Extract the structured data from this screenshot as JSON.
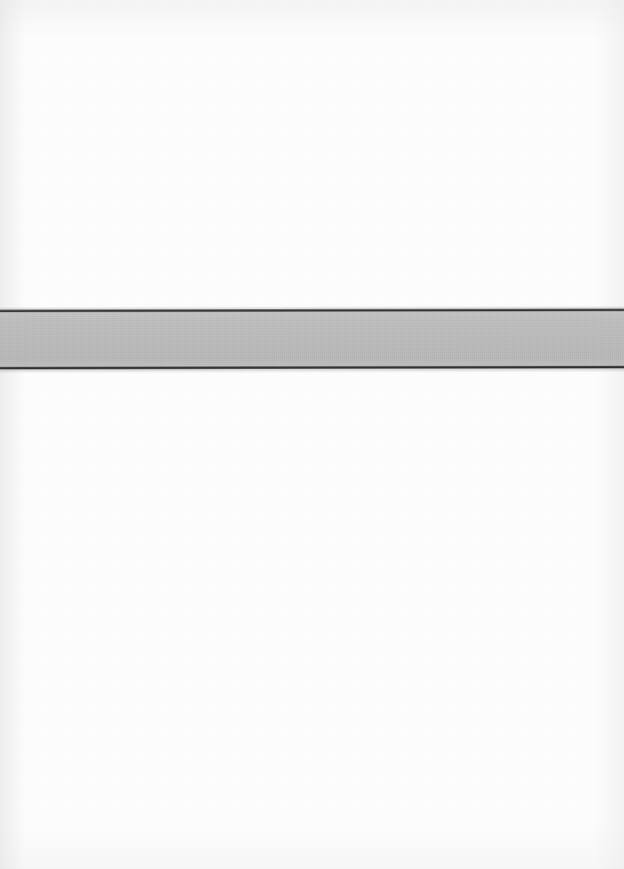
{
  "document": {
    "kind": "scanned-page",
    "page_background": "#ffffff",
    "width": 624,
    "height": 869,
    "text_content": "",
    "notes": ""
  },
  "band": {
    "name": "horizontal-gray-band",
    "top": 309,
    "height": 60,
    "left": 0,
    "width": 624,
    "fill_color": "#bcbcbc",
    "rule_color": "#2f2f2f",
    "rule_thickness": 3,
    "skew_degrees": -0.1,
    "label": ""
  },
  "regions": {
    "above_band": {
      "name": "blank-area-above",
      "top": 0,
      "height": 309,
      "color": "#ffffff",
      "label": ""
    },
    "below_band": {
      "name": "blank-area-below",
      "top": 369,
      "height": 500,
      "color": "#ffffff",
      "label": ""
    }
  }
}
